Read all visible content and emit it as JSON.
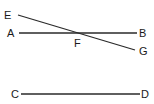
{
  "diagram": {
    "type": "geometry-lines",
    "colors": {
      "line": "#2a2a2a",
      "label": "#1a1a1a",
      "background": "#ffffff"
    },
    "points": {
      "E": {
        "label": "E",
        "x": 18,
        "y": 15
      },
      "A": {
        "label": "A",
        "x": 19,
        "y": 33
      },
      "B": {
        "label": "B",
        "x": 137,
        "y": 33
      },
      "F": {
        "label": "F",
        "x": 80,
        "y": 33
      },
      "G": {
        "label": "G",
        "x": 135,
        "y": 50
      },
      "C": {
        "label": "C",
        "x": 21,
        "y": 94
      },
      "D": {
        "label": "D",
        "x": 140,
        "y": 94
      }
    },
    "segments": [
      {
        "name": "AB",
        "from": "A",
        "to": "B"
      },
      {
        "name": "EG",
        "from": "E",
        "to": "G"
      },
      {
        "name": "CD",
        "from": "C",
        "to": "D"
      }
    ]
  }
}
